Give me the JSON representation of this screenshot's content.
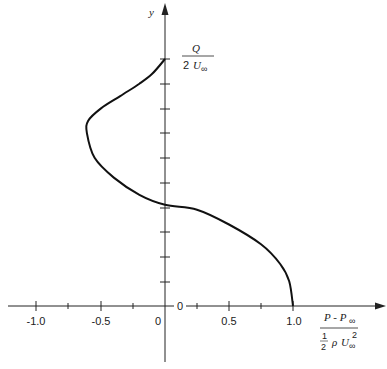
{
  "chart_data": {
    "type": "line",
    "title": "",
    "xlabel": "(P - P∞) / (½ ρ U∞²)",
    "ylabel": "y",
    "y_top_label": "Q / 2U∞",
    "xlim": [
      -1.1,
      1.7
    ],
    "ylim": [
      0,
      1.0
    ],
    "x_ticks": [
      -1.0,
      -0.75,
      -0.5,
      -0.25,
      0,
      0.25,
      0.5,
      0.75,
      1.0
    ],
    "x_tick_labels": [
      "-1.0",
      "-0.5",
      "0",
      "0.5",
      "1.0"
    ],
    "y_ticks_count": 10,
    "y_origin_label": "0",
    "grid": false,
    "legend": null,
    "series": [
      {
        "name": "pressure coefficient along y-axis",
        "x": [
          1.0,
          0.97,
          0.9,
          0.75,
          0.5,
          0.25,
          0.0,
          -0.2,
          -0.4,
          -0.55,
          -0.61,
          -0.6,
          -0.5,
          -0.35,
          -0.2,
          -0.1,
          0.0
        ],
        "y": [
          0.0,
          0.1,
          0.17,
          0.25,
          0.33,
          0.39,
          0.41,
          0.45,
          0.52,
          0.6,
          0.7,
          0.75,
          0.8,
          0.85,
          0.9,
          0.94,
          1.0
        ]
      }
    ]
  },
  "labels": {
    "y_axis": "y",
    "y_top_num": "Q",
    "y_top_den": "2",
    "y_top_den_var": "U",
    "y_top_den_sub": "∞",
    "x_num": "P - P",
    "x_num_sub": "∞",
    "x_den_frac_num": "1",
    "x_den_frac_den": "2",
    "x_den_rho": "ρ",
    "x_den_var": "U",
    "x_den_sub": "∞",
    "x_den_sup": "2",
    "origin_y": "0",
    "origin_x": "0",
    "xt_m10": "-1.0",
    "xt_m05": "-0.5",
    "xt_05": "0.5",
    "xt_10": "1.0"
  }
}
